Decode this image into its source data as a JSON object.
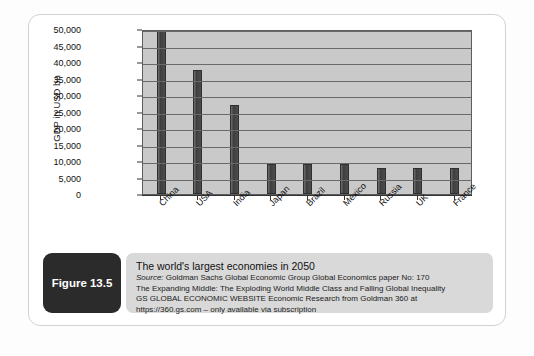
{
  "figure": {
    "badge_label": "Figure 13.5",
    "title": "The world's largest economies in 2050",
    "source_prefix": "Source:",
    "source_text": " Goldman Sachs Global Economic Group Global Economics paper No: 170",
    "line2": "The Expanding Middle: The Exploding World Middle Class and Falling Global Inequality",
    "line3": "GS GLOBAL ECONOMIC WEBSITE Economic Research from Goldman 360 at",
    "line4": "https://360.gs.com – only available via subscription"
  },
  "colors": {
    "bar": "#454545",
    "plot_background": "#c9c9c9",
    "gridline": "#6a6a6a",
    "badge_background": "#2b2b2b",
    "caption_background": "#d9d9d9"
  },
  "chart_data": {
    "type": "bar",
    "title": "",
    "xlabel": "",
    "ylabel": "GDP in USD bn",
    "ylim": [
      0,
      50000
    ],
    "grid": true,
    "legend": "none",
    "ticks": [
      "0",
      "5,000",
      "10,000",
      "15,000",
      "20,000",
      "25,000",
      "30,000",
      "35,000",
      "40,000",
      "45,000",
      "50,000"
    ],
    "tick_values": [
      0,
      5000,
      10000,
      15000,
      20000,
      25000,
      30000,
      35000,
      40000,
      45000,
      50000
    ],
    "categories": [
      "China",
      "USA",
      "India",
      "Japan",
      "Brazil",
      "Mexico",
      "Russia",
      "UK",
      "France"
    ],
    "values": [
      49500,
      37500,
      27000,
      9000,
      9000,
      9000,
      8000,
      8000,
      8000
    ]
  }
}
